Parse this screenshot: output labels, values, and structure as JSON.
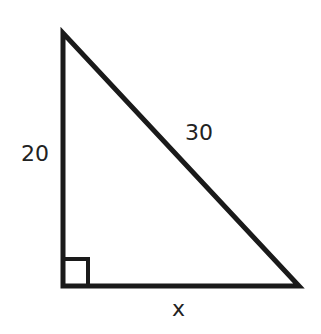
{
  "diagram": {
    "type": "right-triangle",
    "stroke_color": "#1a1a1a",
    "labels": {
      "vertical_leg": "20",
      "hypotenuse": "30",
      "horizontal_leg": "x"
    },
    "right_angle_marker": "bottom-left"
  }
}
